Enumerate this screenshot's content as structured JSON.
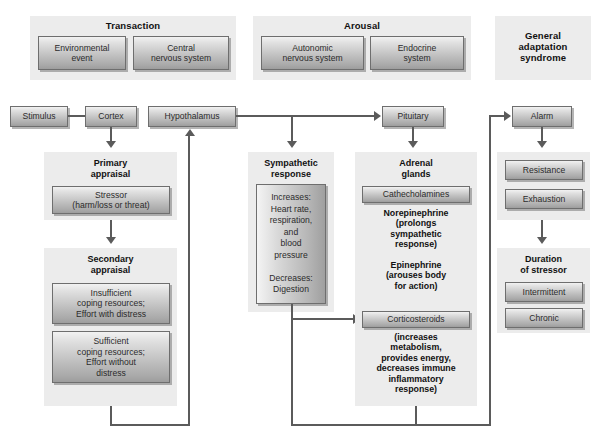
{
  "diagram": {
    "colors": {
      "panel_bg": "#ececec",
      "box_border": "#6e6e6e",
      "connector": "#5b5b5b",
      "text": "#1a1a1a"
    }
  },
  "groups": {
    "transaction": {
      "title": "Transaction",
      "boxes": [
        {
          "label": "Environmental\nevent"
        },
        {
          "label": "Central\nnervous system"
        }
      ]
    },
    "arousal": {
      "title": "Arousal",
      "boxes": [
        {
          "label": "Autonomic\nnervous system"
        },
        {
          "label": "Endocrine\nsystem"
        }
      ]
    },
    "general_adaptation": {
      "title": "General\nadaptation\nsyndrome"
    }
  },
  "flow": {
    "stimulus": "Stimulus",
    "cortex": "Cortex",
    "hypothalamus": "Hypothalamus",
    "pituitary": "Pituitary",
    "alarm": "Alarm"
  },
  "primary_appraisal": {
    "title": "Primary\nappraisal",
    "box": "Stressor\n(harm/loss or threat)"
  },
  "secondary_appraisal": {
    "title": "Secondary\nappraisal",
    "boxes": [
      "Insufficient\ncoping resources;\nEffort with distress",
      "Sufficient\ncoping resources;\nEffort without\ndistress"
    ]
  },
  "sympathetic": {
    "title": "Sympathetic\nresponse",
    "box": "Increases:\nHeart rate,\nrespiration,\nand\nblood\npressure\n\nDecreases:\nDigestion"
  },
  "adrenal": {
    "title": "Adrenal\nglands",
    "catecholamines_label": "Cathecholamines",
    "catecholamines_text": "Norepinephrine\n(prolongs\nsympathetic\nresponse)\n\nEpinephrine\n(arouses body\nfor action)",
    "corticosteroids_label": "Corticosteroids",
    "corticosteroids_text": "(increases\nmetabolism,\nprovides energy,\ndecreases immune\ninflammatory\nresponse)"
  },
  "gas_stages": {
    "boxes": [
      "Resistance",
      "Exhaustion"
    ]
  },
  "duration": {
    "title": "Duration\nof stressor",
    "boxes": [
      "Intermittent",
      "Chronic"
    ]
  }
}
